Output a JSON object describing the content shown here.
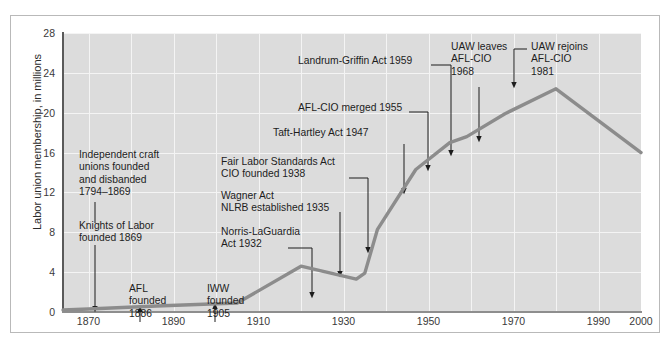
{
  "chart_data": {
    "type": "line",
    "title": "",
    "subtitle": "",
    "xlabel": "",
    "ylabel": "Labor union membership, in millions",
    "xlim": [
      1864,
      2000
    ],
    "ylim": [
      0,
      28
    ],
    "grid": true,
    "legend_position": "none",
    "yticks": [
      0,
      4,
      8,
      12,
      16,
      20,
      24,
      28
    ],
    "xticks": [
      1870,
      1890,
      1910,
      1930,
      1950,
      1970,
      1990,
      2000
    ],
    "series": [
      {
        "name": "Labor union membership",
        "color": "#8c8c8c",
        "x": [
          1864,
          1870,
          1886,
          1905,
          1920,
          1933,
          1935,
          1938,
          1947,
          1955,
          1959,
          1968,
          1980,
          2000
        ],
        "values": [
          0.2,
          0.3,
          0.6,
          0.9,
          4.6,
          3.3,
          3.9,
          8.3,
          14.3,
          17.0,
          17.6,
          19.9,
          22.4,
          16.0
        ]
      }
    ],
    "annotations": [
      {
        "id": "independent-craft-unions",
        "lines": [
          "Independent craft",
          "unions founded",
          "and disbanded",
          "1794–1869"
        ],
        "text": "Independent craft unions founded and disbanded 1794–1869",
        "target_year": 1869
      },
      {
        "id": "knights-of-labor",
        "lines": [
          "Knights of Labor",
          "founded 1869"
        ],
        "text": "Knights of Labor founded 1869",
        "target_year": 1869
      },
      {
        "id": "afl-founded",
        "lines": [
          "AFL",
          "founded",
          "1886"
        ],
        "text": "AFL founded 1886",
        "target_year": 1886
      },
      {
        "id": "iww-founded",
        "lines": [
          "IWW",
          "founded",
          "1905"
        ],
        "text": "IWW founded 1905",
        "target_year": 1905
      },
      {
        "id": "norris-laguardia",
        "lines": [
          "Norris-LaGuardia",
          "Act 1932"
        ],
        "text": "Norris-LaGuardia Act 1932",
        "target_year": 1932
      },
      {
        "id": "wagner-act-nlrb",
        "lines": [
          "Wagner Act",
          "NLRB established 1935"
        ],
        "text": "Wagner Act NLRB established 1935",
        "target_year": 1935
      },
      {
        "id": "fair-labor-standards-cio",
        "lines": [
          "Fair Labor Standards Act",
          "CIO founded 1938"
        ],
        "text": "Fair Labor Standards Act CIO founded 1938",
        "target_year": 1938
      },
      {
        "id": "taft-hartley",
        "lines": [
          "Taft-Hartley Act 1947"
        ],
        "text": "Taft-Hartley Act 1947",
        "target_year": 1947
      },
      {
        "id": "afl-cio-merged",
        "lines": [
          "AFL-CIO merged 1955"
        ],
        "text": "AFL-CIO merged 1955",
        "target_year": 1955
      },
      {
        "id": "landrum-griffin",
        "lines": [
          "Landrum-Griffin Act 1959"
        ],
        "text": "Landrum-Griffin Act 1959",
        "target_year": 1959
      },
      {
        "id": "uaw-leaves",
        "lines": [
          "UAW leaves",
          "AFL-CIO",
          "1968"
        ],
        "text": "UAW leaves AFL-CIO 1968",
        "target_year": 1968
      },
      {
        "id": "uaw-rejoins",
        "lines": [
          "UAW rejoins",
          "AFL-CIO",
          "1981"
        ],
        "text": "UAW rejoins AFL-CIO 1981",
        "target_year": 1981
      }
    ]
  },
  "figure": {
    "plot_bg": "#dcdcdc",
    "grid_color": "#f4f4f4",
    "line_color": "#8c8c8c",
    "axis_color": "#5a5a5a",
    "border_color": "#b9b9b9",
    "text_color": "#1d1d1d"
  }
}
